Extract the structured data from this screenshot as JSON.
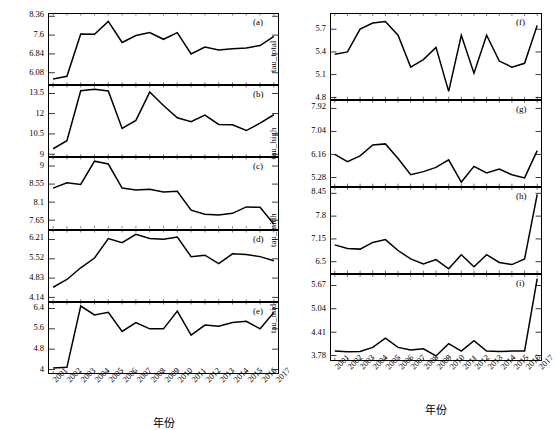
{
  "figure": {
    "x_axis_title": "年份",
    "years": [
      "2001",
      "2002",
      "2003",
      "2004",
      "2005",
      "2006",
      "2007",
      "2008",
      "2009",
      "2010",
      "2011",
      "2012",
      "2013",
      "2014",
      "2015",
      "2016",
      "2017"
    ],
    "line_color": "#000000",
    "background_color": "#ffffff"
  },
  "chart_data": [
    {
      "type": "line",
      "panel": "(a)",
      "column": "left",
      "title": "",
      "xlabel": "年份",
      "ylabel": "tau_total",
      "x": [
        "2001",
        "2002",
        "2003",
        "2004",
        "2005",
        "2006",
        "2007",
        "2008",
        "2009",
        "2010",
        "2011",
        "2012",
        "2013",
        "2014",
        "2015",
        "2016",
        "2017"
      ],
      "values": [
        5.83,
        5.94,
        7.64,
        7.63,
        8.15,
        7.3,
        7.58,
        7.7,
        7.43,
        7.7,
        6.84,
        7.12,
        7.0,
        7.05,
        7.08,
        7.18,
        7.55
      ],
      "yticks": [
        6.08,
        6.84,
        7.6,
        8.36
      ],
      "ylim": [
        5.62,
        8.45
      ],
      "grid": false
    },
    {
      "type": "line",
      "panel": "(b)",
      "column": "left",
      "title": "",
      "xlabel": "年份",
      "ylabel": "tau_high",
      "x": [
        "2001",
        "2002",
        "2003",
        "2004",
        "2005",
        "2006",
        "2007",
        "2008",
        "2009",
        "2010",
        "2011",
        "2012",
        "2013",
        "2014",
        "2015",
        "2016",
        "2017"
      ],
      "values": [
        9.4,
        10.0,
        13.7,
        13.8,
        13.68,
        10.9,
        11.5,
        13.6,
        12.6,
        11.7,
        11.4,
        11.9,
        11.2,
        11.18,
        10.75,
        11.3,
        11.92
      ],
      "yticks": [
        9.0,
        10.5,
        12.0,
        13.5
      ],
      "ylim": [
        8.85,
        14.05
      ],
      "grid": false
    },
    {
      "type": "line",
      "panel": "(c)",
      "column": "left",
      "title": "",
      "xlabel": "年份",
      "ylabel": "tau_midh",
      "x": [
        "2001",
        "2002",
        "2003",
        "2004",
        "2005",
        "2006",
        "2007",
        "2008",
        "2009",
        "2010",
        "2011",
        "2012",
        "2013",
        "2014",
        "2015",
        "2016",
        "2017"
      ],
      "values": [
        8.45,
        8.58,
        8.54,
        9.12,
        9.05,
        8.45,
        8.4,
        8.42,
        8.35,
        8.37,
        7.9,
        7.8,
        7.78,
        7.82,
        7.98,
        7.97,
        7.55
      ],
      "yticks": [
        7.65,
        8.1,
        8.55,
        9.0
      ],
      "ylim": [
        7.45,
        9.2
      ],
      "grid": false
    },
    {
      "type": "line",
      "panel": "(d)",
      "column": "left",
      "title": "",
      "xlabel": "年份",
      "ylabel": "tau_midl",
      "x": [
        "2001",
        "2002",
        "2003",
        "2004",
        "2005",
        "2006",
        "2007",
        "2008",
        "2009",
        "2010",
        "2011",
        "2012",
        "2013",
        "2014",
        "2015",
        "2016",
        "2017"
      ],
      "values": [
        4.5,
        4.78,
        5.2,
        5.55,
        6.25,
        6.1,
        6.4,
        6.25,
        6.22,
        6.3,
        5.6,
        5.65,
        5.35,
        5.7,
        5.68,
        5.6,
        5.45
      ],
      "yticks": [
        4.14,
        4.83,
        5.52,
        6.21
      ],
      "ylim": [
        4.0,
        6.52
      ],
      "grid": false
    },
    {
      "type": "line",
      "panel": "(e)",
      "column": "left",
      "title": "",
      "xlabel": "年份",
      "ylabel": "tau_low",
      "x": [
        "2001",
        "2002",
        "2003",
        "2004",
        "2005",
        "2006",
        "2007",
        "2008",
        "2009",
        "2010",
        "2011",
        "2012",
        "2013",
        "2014",
        "2015",
        "2016",
        "2017"
      ],
      "values": [
        4.05,
        4.08,
        6.5,
        6.15,
        6.25,
        5.5,
        5.85,
        5.6,
        5.6,
        6.3,
        5.35,
        5.75,
        5.7,
        5.85,
        5.9,
        5.6,
        6.25
      ],
      "yticks": [
        4.0,
        4.8,
        5.6,
        6.4
      ],
      "ylim": [
        3.85,
        6.62
      ],
      "grid": false
    },
    {
      "type": "line",
      "panel": "(f)",
      "column": "right",
      "title": "",
      "xlabel": "年份",
      "ylabel": "tau_total",
      "x": [
        "2001",
        "2002",
        "2003",
        "2004",
        "2005",
        "2006",
        "2007",
        "2008",
        "2009",
        "2010",
        "2011",
        "2012",
        "2013",
        "2014",
        "2015",
        "2016",
        "2017"
      ],
      "values": [
        5.37,
        5.4,
        5.7,
        5.78,
        5.8,
        5.62,
        5.2,
        5.3,
        5.46,
        4.88,
        5.62,
        5.12,
        5.62,
        5.28,
        5.2,
        5.25,
        5.75
      ],
      "yticks": [
        4.8,
        5.1,
        5.4,
        5.7
      ],
      "ylim": [
        4.78,
        5.9
      ],
      "grid": false
    },
    {
      "type": "line",
      "panel": "(g)",
      "column": "right",
      "title": "",
      "xlabel": "年份",
      "ylabel": "tau_high",
      "x": [
        "2001",
        "2002",
        "2003",
        "2004",
        "2005",
        "2006",
        "2007",
        "2008",
        "2009",
        "2010",
        "2011",
        "2012",
        "2013",
        "2014",
        "2015",
        "2016",
        "2017"
      ],
      "values": [
        6.16,
        5.88,
        6.1,
        6.52,
        6.56,
        6.0,
        5.38,
        5.5,
        5.66,
        5.95,
        5.1,
        5.7,
        5.45,
        5.6,
        5.38,
        5.26,
        6.3
      ],
      "yticks": [
        5.28,
        6.16,
        7.04,
        7.92
      ],
      "ylim": [
        4.95,
        8.2
      ],
      "grid": false
    },
    {
      "type": "line",
      "panel": "(h)",
      "column": "right",
      "title": "",
      "xlabel": "年份",
      "ylabel": "tau_midh",
      "x": [
        "2001",
        "2002",
        "2003",
        "2004",
        "2005",
        "2006",
        "2007",
        "2008",
        "2009",
        "2010",
        "2011",
        "2012",
        "2013",
        "2014",
        "2015",
        "2016",
        "2017"
      ],
      "values": [
        6.98,
        6.88,
        6.86,
        7.05,
        7.13,
        6.82,
        6.58,
        6.44,
        6.56,
        6.3,
        6.7,
        6.36,
        6.7,
        6.48,
        6.42,
        6.58,
        8.42
      ],
      "yticks": [
        6.5,
        7.15,
        7.8,
        8.45
      ],
      "ylim": [
        6.18,
        8.6
      ],
      "grid": false
    },
    {
      "type": "line",
      "panel": "(i)",
      "column": "right",
      "title": "",
      "xlabel": "年份",
      "ylabel": "tau_midl",
      "x": [
        "2001",
        "2002",
        "2003",
        "2004",
        "2005",
        "2006",
        "2007",
        "2008",
        "2009",
        "2010",
        "2011",
        "2012",
        "2013",
        "2014",
        "2015",
        "2016",
        "2017"
      ],
      "values": [
        3.9,
        3.88,
        3.89,
        4.0,
        4.25,
        4.0,
        3.93,
        3.96,
        3.77,
        4.1,
        3.9,
        4.18,
        3.9,
        3.89,
        3.9,
        3.9,
        5.85
      ],
      "yticks": [
        3.78,
        4.41,
        5.04,
        5.67
      ],
      "ylim": [
        3.66,
        5.95
      ],
      "grid": false
    }
  ]
}
